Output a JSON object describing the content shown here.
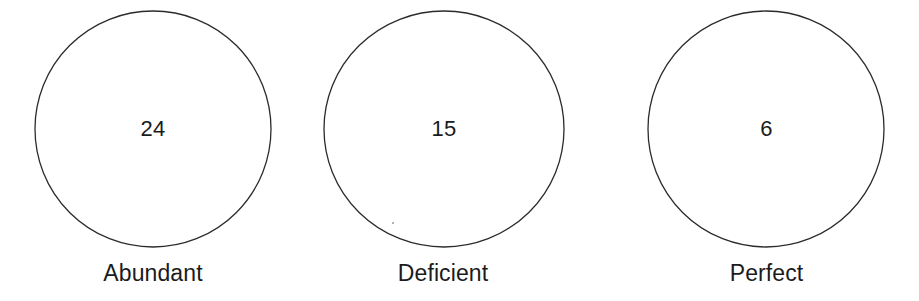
{
  "diagram": {
    "type": "circles",
    "background_color": "#ffffff",
    "stroke_color": "#2b2b2b",
    "text_color": "#1b1b1b",
    "groups": [
      {
        "id": "abundant",
        "value": "24",
        "label": "Abundant",
        "cx": 153,
        "cy": 129,
        "rx": 118,
        "ry": 118,
        "value_y": 118,
        "label_y": 262
      },
      {
        "id": "deficient",
        "value": "15",
        "label": "Deficient",
        "cx": 444,
        "cy": 129,
        "rx": 120,
        "ry": 118,
        "value_y": 118,
        "label_y": 262
      },
      {
        "id": "perfect",
        "value": "6",
        "label": "Perfect",
        "cx": 766,
        "cy": 129,
        "rx": 118,
        "ry": 118,
        "value_y": 118,
        "label_y": 262
      }
    ]
  }
}
